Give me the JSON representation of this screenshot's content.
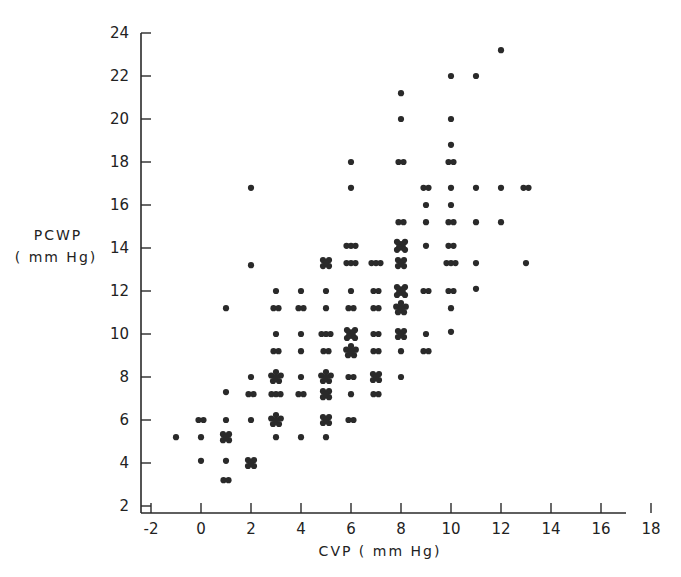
{
  "chart_data": {
    "type": "scatter",
    "title": "",
    "xlabel": "CVP ( mm Hg)",
    "ylabel_line1": "PCWP",
    "ylabel_line2": "( mm Hg)",
    "xlim": [
      -2.4,
      18
    ],
    "ylim": [
      1.7,
      24
    ],
    "x_ticks": [
      -2,
      0,
      2,
      4,
      6,
      8,
      10,
      12,
      14,
      16,
      18
    ],
    "y_ticks": [
      2,
      4,
      6,
      8,
      10,
      12,
      14,
      16,
      18,
      20,
      22,
      24
    ],
    "grid": false,
    "legend": "none",
    "marker_types": {
      "1": "single dot",
      "2": "double dot",
      "3": "triple dot",
      "4": "cluster (square)",
      "5": "cluster (star)",
      "x": "cross cluster"
    },
    "points": [
      {
        "x": -1,
        "y": 5.2,
        "n": 1
      },
      {
        "x": 0,
        "y": 6.0,
        "n": 2
      },
      {
        "x": 0,
        "y": 5.2,
        "n": 1
      },
      {
        "x": 0,
        "y": 4.1,
        "n": 1
      },
      {
        "x": 1,
        "y": 11.2,
        "n": 1
      },
      {
        "x": 1,
        "y": 7.3,
        "n": 1
      },
      {
        "x": 1,
        "y": 6.0,
        "n": 1
      },
      {
        "x": 1,
        "y": 5.2,
        "n": 4
      },
      {
        "x": 1,
        "y": 4.1,
        "n": 1
      },
      {
        "x": 1,
        "y": 3.2,
        "n": 2
      },
      {
        "x": 2,
        "y": 16.8,
        "n": 1
      },
      {
        "x": 2,
        "y": 13.2,
        "n": 1
      },
      {
        "x": 2,
        "y": 8.0,
        "n": 1
      },
      {
        "x": 2,
        "y": 7.2,
        "n": 2
      },
      {
        "x": 2,
        "y": 6.0,
        "n": 1
      },
      {
        "x": 2,
        "y": 4.0,
        "n": 4
      },
      {
        "x": 3,
        "y": 12.0,
        "n": 1
      },
      {
        "x": 3,
        "y": 11.2,
        "n": 2
      },
      {
        "x": 3,
        "y": 10.0,
        "n": 1
      },
      {
        "x": 3,
        "y": 9.2,
        "n": 2
      },
      {
        "x": 3,
        "y": 8.0,
        "n": 5
      },
      {
        "x": 3,
        "y": 7.2,
        "n": 3
      },
      {
        "x": 3,
        "y": 6.0,
        "n": 5
      },
      {
        "x": 3,
        "y": 5.2,
        "n": 1
      },
      {
        "x": 4,
        "y": 12.0,
        "n": 1
      },
      {
        "x": 4,
        "y": 11.2,
        "n": 2
      },
      {
        "x": 4,
        "y": 10.0,
        "n": 1
      },
      {
        "x": 4,
        "y": 9.2,
        "n": 1
      },
      {
        "x": 4,
        "y": 8.0,
        "n": 1
      },
      {
        "x": 4,
        "y": 7.2,
        "n": 2
      },
      {
        "x": 4,
        "y": 5.2,
        "n": 1
      },
      {
        "x": 5,
        "y": 13.3,
        "n": 4
      },
      {
        "x": 5,
        "y": 12.0,
        "n": 1
      },
      {
        "x": 5,
        "y": 11.2,
        "n": 1
      },
      {
        "x": 5,
        "y": 10.0,
        "n": 3
      },
      {
        "x": 5,
        "y": 9.2,
        "n": 2
      },
      {
        "x": 5,
        "y": 8.0,
        "n": 5
      },
      {
        "x": 5,
        "y": 7.2,
        "n": 4
      },
      {
        "x": 5,
        "y": 6.0,
        "n": 4
      },
      {
        "x": 5,
        "y": 5.2,
        "n": 1
      },
      {
        "x": 6,
        "y": 18.0,
        "n": 1
      },
      {
        "x": 6,
        "y": 16.8,
        "n": 1
      },
      {
        "x": 6,
        "y": 14.1,
        "n": 3
      },
      {
        "x": 6,
        "y": 13.3,
        "n": 3
      },
      {
        "x": 6,
        "y": 12.0,
        "n": 1
      },
      {
        "x": 6,
        "y": 11.2,
        "n": 2
      },
      {
        "x": 6,
        "y": 10.0,
        "n": "x"
      },
      {
        "x": 6,
        "y": 9.2,
        "n": 5
      },
      {
        "x": 6,
        "y": 8.0,
        "n": 2
      },
      {
        "x": 6,
        "y": 7.2,
        "n": 1
      },
      {
        "x": 6,
        "y": 6.0,
        "n": 2
      },
      {
        "x": 7,
        "y": 13.3,
        "n": 3
      },
      {
        "x": 7,
        "y": 12.0,
        "n": 2
      },
      {
        "x": 7,
        "y": 11.2,
        "n": 2
      },
      {
        "x": 7,
        "y": 10.0,
        "n": 2
      },
      {
        "x": 7,
        "y": 9.2,
        "n": 2
      },
      {
        "x": 7,
        "y": 8.0,
        "n": 4
      },
      {
        "x": 7,
        "y": 7.2,
        "n": 2
      },
      {
        "x": 8,
        "y": 21.2,
        "n": 1
      },
      {
        "x": 8,
        "y": 20.0,
        "n": 1
      },
      {
        "x": 8,
        "y": 18.0,
        "n": 2
      },
      {
        "x": 8,
        "y": 15.2,
        "n": 2
      },
      {
        "x": 8,
        "y": 14.1,
        "n": "x"
      },
      {
        "x": 8,
        "y": 13.3,
        "n": 4
      },
      {
        "x": 8,
        "y": 12.0,
        "n": "x"
      },
      {
        "x": 8,
        "y": 11.2,
        "n": 5
      },
      {
        "x": 8,
        "y": 10.0,
        "n": 4
      },
      {
        "x": 8,
        "y": 9.2,
        "n": 1
      },
      {
        "x": 8,
        "y": 8.0,
        "n": 1
      },
      {
        "x": 9,
        "y": 16.8,
        "n": 2
      },
      {
        "x": 9,
        "y": 16.0,
        "n": 1
      },
      {
        "x": 9,
        "y": 15.2,
        "n": 1
      },
      {
        "x": 9,
        "y": 14.1,
        "n": 1
      },
      {
        "x": 9,
        "y": 12.0,
        "n": 2
      },
      {
        "x": 9,
        "y": 10.0,
        "n": 1
      },
      {
        "x": 9,
        "y": 9.2,
        "n": 2
      },
      {
        "x": 10,
        "y": 22.0,
        "n": 1
      },
      {
        "x": 10,
        "y": 20.0,
        "n": 1
      },
      {
        "x": 10,
        "y": 18.8,
        "n": 1
      },
      {
        "x": 10,
        "y": 18.0,
        "n": 2
      },
      {
        "x": 10,
        "y": 16.8,
        "n": 1
      },
      {
        "x": 10,
        "y": 16.0,
        "n": 1
      },
      {
        "x": 10,
        "y": 15.2,
        "n": 2
      },
      {
        "x": 10,
        "y": 14.1,
        "n": 2
      },
      {
        "x": 10,
        "y": 13.3,
        "n": 3
      },
      {
        "x": 10,
        "y": 12.0,
        "n": 2
      },
      {
        "x": 10,
        "y": 11.2,
        "n": 1
      },
      {
        "x": 10,
        "y": 10.1,
        "n": 1
      },
      {
        "x": 11,
        "y": 22.0,
        "n": 1
      },
      {
        "x": 11,
        "y": 16.8,
        "n": 1
      },
      {
        "x": 11,
        "y": 15.2,
        "n": 1
      },
      {
        "x": 11,
        "y": 13.3,
        "n": 1
      },
      {
        "x": 11,
        "y": 12.1,
        "n": 1
      },
      {
        "x": 12,
        "y": 23.2,
        "n": 1
      },
      {
        "x": 12,
        "y": 16.8,
        "n": 1
      },
      {
        "x": 12,
        "y": 15.2,
        "n": 1
      },
      {
        "x": 13,
        "y": 16.8,
        "n": 2
      },
      {
        "x": 13,
        "y": 13.3,
        "n": 1
      }
    ]
  }
}
